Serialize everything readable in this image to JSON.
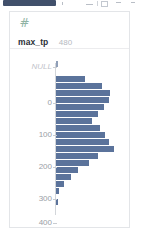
{
  "window_chrome": {
    "tab_name": "",
    "controls": [
      "minimize",
      "maximize",
      "close"
    ]
  },
  "card": {
    "type_icon": "hash-icon",
    "icon_glyph": "#",
    "field_name": "max_tp",
    "count_label": "480"
  },
  "colors": {
    "bar": "#5b739b",
    "null_bar": "#8f9fb8",
    "axis": "#d3d6da",
    "tick_text": "#9a9ea6",
    "null_text": "#bfc3ca",
    "field_text": "#2b2f36",
    "count_text": "#b6bac1",
    "card_border": "#e3e5e8",
    "chrome_tab": "#41506b"
  },
  "chart_data": {
    "type": "bar",
    "orientation": "horizontal",
    "title": "",
    "xlabel": "",
    "ylabel": "",
    "grid": false,
    "legend": false,
    "ylim": [
      -50,
      430
    ],
    "xlim": [
      0,
      100
    ],
    "tick_labels": [
      "NULL",
      "0",
      "100",
      "200",
      "300",
      "400"
    ],
    "tick_positions_px": [
      18,
      54,
      86,
      118,
      150,
      174
    ],
    "categories": [
      "NULL",
      "-25",
      "0",
      "25",
      "50",
      "75",
      "100",
      "125",
      "150",
      "175",
      "200",
      "225",
      "250",
      "275",
      "300",
      "325",
      "350",
      "375",
      "400"
    ],
    "values": [
      4,
      40,
      63,
      74,
      73,
      66,
      58,
      49,
      60,
      67,
      72,
      80,
      58,
      45,
      30,
      20,
      11,
      3,
      2
    ],
    "bars_px": [
      {
        "label": "NULL",
        "top": 12,
        "width": 2
      },
      {
        "label": "-25",
        "top": 27,
        "width": 29
      },
      {
        "label": "0",
        "top": 34,
        "width": 46
      },
      {
        "label": "25",
        "top": 41,
        "width": 54
      },
      {
        "label": "50",
        "top": 48,
        "width": 53
      },
      {
        "label": "75",
        "top": 55,
        "width": 48
      },
      {
        "label": "100",
        "top": 62,
        "width": 42
      },
      {
        "label": "125",
        "top": 69,
        "width": 36
      },
      {
        "label": "150",
        "top": 76,
        "width": 44
      },
      {
        "label": "175",
        "top": 83,
        "width": 49
      },
      {
        "label": "200",
        "top": 90,
        "width": 53
      },
      {
        "label": "225",
        "top": 97,
        "width": 58
      },
      {
        "label": "250",
        "top": 104,
        "width": 42
      },
      {
        "label": "275",
        "top": 111,
        "width": 33
      },
      {
        "label": "300",
        "top": 118,
        "width": 22
      },
      {
        "label": "325",
        "top": 125,
        "width": 15
      },
      {
        "label": "350",
        "top": 132,
        "width": 8
      },
      {
        "label": "375",
        "top": 139,
        "width": 3
      },
      {
        "label": "400",
        "top": 150,
        "width": 2
      }
    ]
  }
}
